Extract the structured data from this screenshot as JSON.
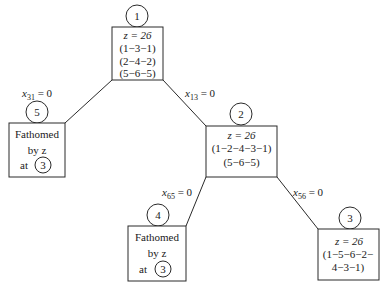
{
  "diagram": {
    "type": "branch-and-bound tree",
    "nodes": [
      {
        "id": "1",
        "label": "1",
        "lines": [
          "z = 26",
          "(1−3−1)",
          "(2−4−2)",
          "(5−6−5)"
        ]
      },
      {
        "id": "5",
        "label": "5",
        "lines": [
          "Fathomed",
          "by z",
          "at"
        ],
        "ref": "3"
      },
      {
        "id": "2",
        "label": "2",
        "lines": [
          "z = 26",
          "(1−2−4−3−1)",
          "(5−6−5)"
        ]
      },
      {
        "id": "4",
        "label": "4",
        "lines": [
          "Fathomed",
          "by z",
          "at"
        ],
        "ref": "3"
      },
      {
        "id": "3",
        "label": "3",
        "lines": [
          "z = 26",
          "(1−5−6−2−",
          "4−3−1)"
        ]
      }
    ],
    "edges": [
      {
        "from": "1",
        "to": "5",
        "var": "x",
        "sub": "31",
        "rhs": " = 0"
      },
      {
        "from": "1",
        "to": "2",
        "var": "x",
        "sub": "13",
        "rhs": " = 0"
      },
      {
        "from": "2",
        "to": "4",
        "var": "x",
        "sub": "65",
        "rhs": " = 0"
      },
      {
        "from": "2",
        "to": "3",
        "var": "x",
        "sub": "56",
        "rhs": " = 0"
      }
    ]
  }
}
